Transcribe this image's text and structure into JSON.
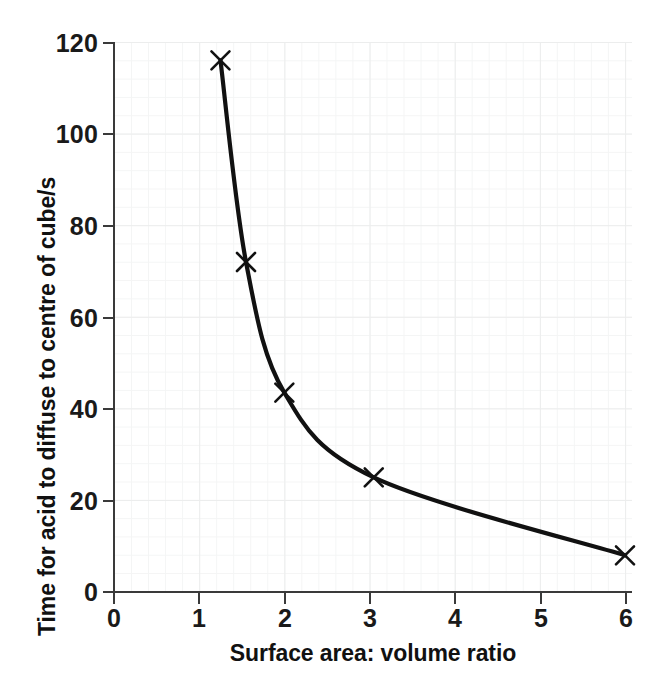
{
  "chart_data": {
    "type": "line",
    "title": "",
    "xlabel": "Surface area: volume ratio",
    "ylabel": "Time for acid to diffuse to centre of cube/s",
    "xlim": [
      0,
      6
    ],
    "ylim": [
      0,
      120
    ],
    "xticks": [
      "0",
      "1",
      "2",
      "3",
      "4",
      "5",
      "6"
    ],
    "yticks": [
      "0",
      "20",
      "40",
      "60",
      "80",
      "100",
      "120"
    ],
    "grid": true,
    "legend": "none",
    "marker": "x-cross",
    "line_color": "#111111",
    "marker_color": "#111111",
    "grid_color": "#eceded",
    "axis_color": "#3a3a3a",
    "series": [
      {
        "name": "Time to diffuse to centre of cube",
        "x": [
          1.25,
          1.55,
          2.0,
          3.05,
          6.0
        ],
        "y": [
          116,
          72,
          43.5,
          25,
          8
        ]
      }
    ],
    "points": [
      {
        "x": 1.25,
        "y": 116
      },
      {
        "x": 1.55,
        "y": 72
      },
      {
        "x": 2.0,
        "y": 43.5
      },
      {
        "x": 3.05,
        "y": 25
      },
      {
        "x": 6.0,
        "y": 8
      }
    ]
  },
  "axes": {
    "x_title": "Surface area: volume ratio",
    "y_title": "Time for acid to diffuse to centre of cube/s",
    "x_tick_labels": [
      "0",
      "1",
      "2",
      "3",
      "4",
      "5",
      "6"
    ],
    "y_tick_labels": [
      "0",
      "20",
      "40",
      "60",
      "80",
      "100",
      "120"
    ]
  }
}
